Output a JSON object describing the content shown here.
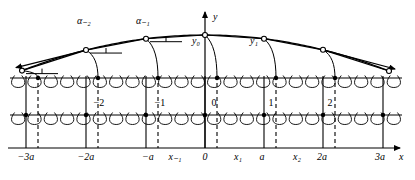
{
  "figure": {
    "axes": {
      "x_axis_label": "x",
      "y_axis_label": "y"
    },
    "colors": {
      "stroke": "#000000",
      "background": "#ffffff"
    },
    "x_tick_labels": [
      {
        "id": "m3a",
        "text": "−3a",
        "x": 26
      },
      {
        "id": "m2a",
        "text": "−2a",
        "x": 86
      },
      {
        "id": "ma",
        "text": "−a",
        "x": 148
      },
      {
        "id": "xm1",
        "text": "x₋₁",
        "x": 175
      },
      {
        "id": "zero",
        "text": "0",
        "x": 205
      },
      {
        "id": "x1",
        "text": "x₁",
        "x": 238
      },
      {
        "id": "a",
        "text": "a",
        "x": 262
      },
      {
        "id": "x2",
        "text": "x₂",
        "x": 297
      },
      {
        "id": "2a",
        "text": "2a",
        "x": 322
      },
      {
        "id": "3a",
        "text": "3a",
        "x": 380
      },
      {
        "id": "xax",
        "text": "x",
        "x": 401
      }
    ],
    "cell_labels": [
      {
        "text": "−2",
        "x": 99
      },
      {
        "text": "−1",
        "x": 160
      },
      {
        "text": "0",
        "x": 214
      },
      {
        "text": "1",
        "x": 271
      },
      {
        "text": "2",
        "x": 330
      }
    ],
    "angle_labels": [
      {
        "text": "α₋₂",
        "x": 84
      },
      {
        "text": "α₋₁",
        "x": 143
      }
    ],
    "displacement_labels": [
      {
        "text": "y₀",
        "x": 196
      },
      {
        "text": "y₁",
        "x": 254
      }
    ],
    "lattice": {
      "solid_verticals_x": [
        26,
        86,
        146,
        205,
        264,
        323,
        383
      ],
      "dashed_verticals_x": [
        38,
        98,
        158,
        217,
        276,
        335
      ],
      "node_dots_row1_x": [
        38,
        98,
        158,
        217,
        276,
        335
      ],
      "node_dots_row2_x": [
        26,
        86,
        146,
        205,
        264,
        323,
        383
      ],
      "coil_row1_y": 78,
      "coil_row2_y": 115,
      "x_axis_y": 148,
      "coil_count_row1": 24,
      "coil_count_row2": 24
    },
    "curve": {
      "type": "arched pendulum envelope",
      "apex_x": 205,
      "apex_y": 35,
      "left_end_x": 22,
      "right_end_x": 389,
      "end_y": 71,
      "markers_x": [
        22,
        86,
        146,
        205,
        264,
        323,
        389
      ]
    }
  }
}
